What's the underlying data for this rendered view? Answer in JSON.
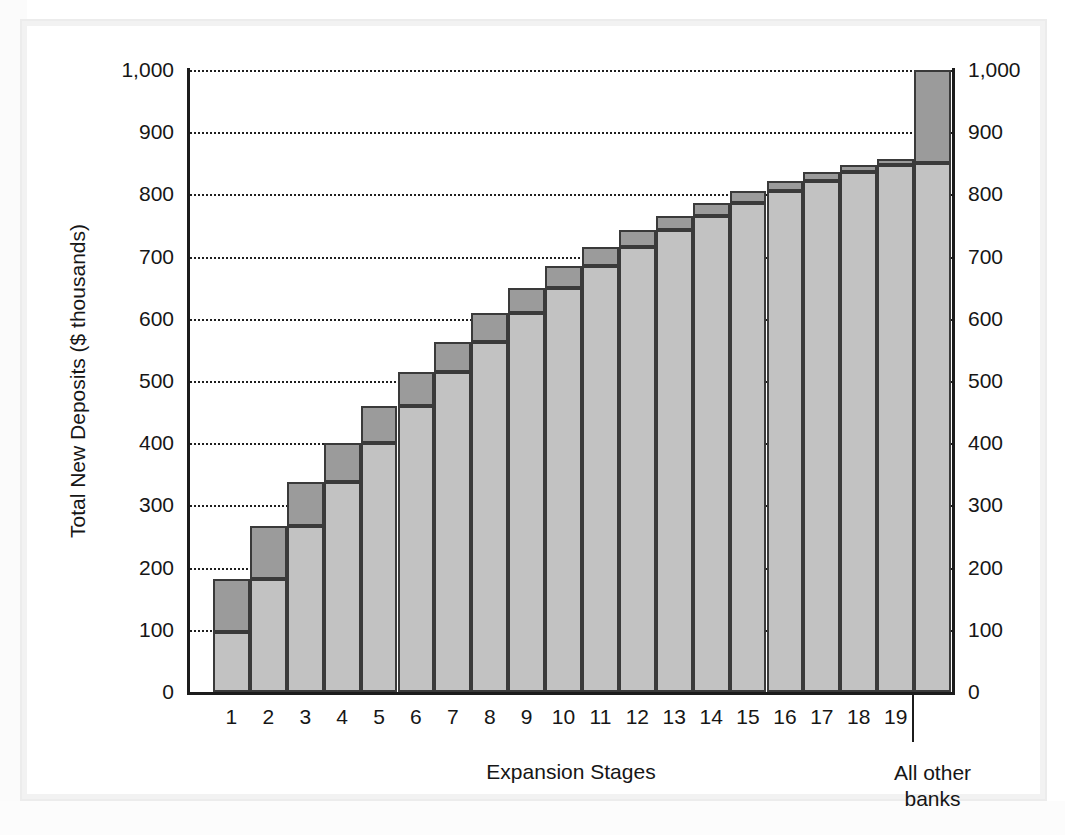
{
  "chart_data": {
    "type": "bar",
    "title": "",
    "subtitle": "",
    "xlabel": "Expansion Stages",
    "ylabel": "Total New Deposits ($ thousands)",
    "ylim": [
      0,
      1000
    ],
    "ytick_labels": [
      "0",
      "100",
      "200",
      "300",
      "400",
      "500",
      "600",
      "700",
      "800",
      "900",
      "1,000"
    ],
    "ytick_values": [
      0,
      100,
      200,
      300,
      400,
      500,
      600,
      700,
      800,
      900,
      1000
    ],
    "right_axis_labels": [
      "0",
      "100",
      "200",
      "300",
      "400",
      "500",
      "600",
      "700",
      "800",
      "900",
      "1,000"
    ],
    "grid": true,
    "grid_style": "dotted",
    "legend": "none",
    "stacked": true,
    "series": [
      {
        "name": "Prior cumulative deposits",
        "color": "#c2c2c2"
      },
      {
        "name": "New deposits at this stage",
        "color": "#9b9b9b"
      }
    ],
    "categories": [
      "1",
      "2",
      "3",
      "4",
      "5",
      "6",
      "7",
      "8",
      "9",
      "10",
      "11",
      "12",
      "13",
      "14",
      "15",
      "16",
      "17",
      "18",
      "19",
      "All other banks"
    ],
    "category_tail_label": "All other\nbanks",
    "bars": [
      {
        "stage": "1",
        "base": 100,
        "increment": 80,
        "total": 180
      },
      {
        "stage": "2",
        "base": 180,
        "increment": 64,
        "total": 244
      },
      {
        "stage": "3",
        "base": 244,
        "increment": 51,
        "total": 295
      },
      {
        "stage": "4",
        "base": 295,
        "increment": 41,
        "total": 336
      },
      {
        "stage": "5",
        "base": 336,
        "increment": 33,
        "total": 369
      },
      {
        "stage": "6",
        "base": 369,
        "increment": 26,
        "total": 395
      },
      {
        "stage": "7",
        "base": 395,
        "increment": 21,
        "total": 416
      },
      {
        "stage": "8",
        "base": 416,
        "increment": 17,
        "total": 433
      },
      {
        "stage": "9",
        "base": 433,
        "increment": 13,
        "total": 446
      },
      {
        "stage": "10",
        "base": 446,
        "increment": 11,
        "total": 457
      },
      {
        "stage": "11",
        "base": 457,
        "increment": 9,
        "total": 466
      },
      {
        "stage": "12",
        "base": 466,
        "increment": 7,
        "total": 473
      },
      {
        "stage": "13",
        "base": 473,
        "increment": 5,
        "total": 478
      },
      {
        "stage": "14",
        "base": 478,
        "increment": 4,
        "total": 482
      },
      {
        "stage": "15",
        "base": 482,
        "increment": 4,
        "total": 486
      },
      {
        "stage": "16",
        "base": 486,
        "increment": 3,
        "total": 489
      },
      {
        "stage": "17",
        "base": 489,
        "increment": 2,
        "total": 491
      },
      {
        "stage": "18",
        "base": 491,
        "increment": 2,
        "total": 493
      },
      {
        "stage": "19",
        "base": 493,
        "increment": 1,
        "total": 494
      },
      {
        "stage": "All other banks",
        "base": 850,
        "increment": 150,
        "total": 1000
      }
    ],
    "plot_bars": [
      {
        "stage": "1",
        "base": 97,
        "total": 182
      },
      {
        "stage": "2",
        "base": 182,
        "total": 267
      },
      {
        "stage": "3",
        "base": 267,
        "total": 337
      },
      {
        "stage": "4",
        "base": 337,
        "total": 400
      },
      {
        "stage": "5",
        "base": 400,
        "total": 460
      },
      {
        "stage": "6",
        "base": 460,
        "total": 514
      },
      {
        "stage": "7",
        "base": 514,
        "total": 562
      },
      {
        "stage": "8",
        "base": 562,
        "total": 609
      },
      {
        "stage": "9",
        "base": 609,
        "total": 650
      },
      {
        "stage": "10",
        "base": 650,
        "total": 685
      },
      {
        "stage": "11",
        "base": 685,
        "total": 716
      },
      {
        "stage": "12",
        "base": 716,
        "total": 742
      },
      {
        "stage": "13",
        "base": 742,
        "total": 766
      },
      {
        "stage": "14",
        "base": 766,
        "total": 787
      },
      {
        "stage": "15",
        "base": 787,
        "total": 806
      },
      {
        "stage": "16",
        "base": 806,
        "total": 822
      },
      {
        "stage": "17",
        "base": 822,
        "total": 836
      },
      {
        "stage": "18",
        "base": 836,
        "total": 847
      },
      {
        "stage": "19",
        "base": 847,
        "total": 857
      },
      {
        "stage": "All other banks",
        "base": 850,
        "total": 1000
      }
    ]
  }
}
